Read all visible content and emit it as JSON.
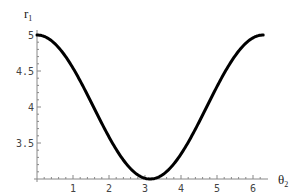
{
  "chart_data": {
    "type": "line",
    "title": "",
    "xlabel": "θ2",
    "ylabel": "r1",
    "xlabel_main": "θ",
    "xlabel_sub": "2",
    "ylabel_main": "r",
    "ylabel_sub": "1",
    "xlim": [
      0,
      6.2832
    ],
    "ylim": [
      3,
      5
    ],
    "xticks": [
      1,
      2,
      3,
      4,
      5,
      6
    ],
    "xtick_labels": [
      "1",
      "2",
      "3",
      "4",
      "5",
      "6"
    ],
    "yticks": [
      3.5,
      4,
      4.5,
      5
    ],
    "ytick_labels": [
      "3.5",
      "4",
      "4.5",
      "5"
    ],
    "grid": false,
    "legend": null,
    "series": [
      {
        "name": "r1(θ2)",
        "formula": "4 + cos(θ2)",
        "x": [
          0,
          0.5,
          1,
          1.5,
          2,
          2.5,
          3,
          3.1416,
          3.5,
          4,
          4.5,
          5,
          5.5,
          6,
          6.2832
        ],
        "values": [
          5.0,
          4.88,
          4.54,
          4.07,
          3.58,
          3.2,
          3.01,
          3.0,
          3.06,
          3.35,
          3.79,
          4.28,
          4.71,
          4.96,
          5.0
        ],
        "color": "#000000"
      }
    ]
  },
  "colors": {
    "axis": "#888888",
    "curve": "#000000",
    "background": "#ffffff"
  }
}
